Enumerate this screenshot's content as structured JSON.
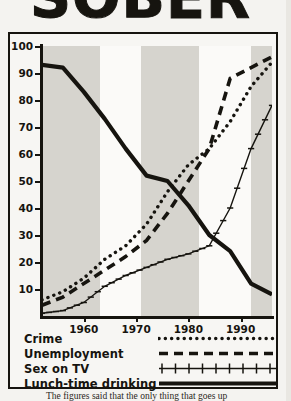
{
  "headline": {
    "text": "SOBER"
  },
  "caption": {
    "text": "The figures said that the only thing that goes up"
  },
  "chart": {
    "yaxis": {
      "ticks": [
        100,
        90,
        80,
        70,
        60,
        50,
        40,
        30,
        20,
        10
      ],
      "min": 0,
      "max": 100
    },
    "xaxis": {
      "ticks": [
        1960,
        1970,
        1980,
        1990
      ],
      "min": 1952,
      "max": 1996
    },
    "bands": [
      {
        "from": 1952,
        "to": 1963
      },
      {
        "from": 1971,
        "to": 1982
      },
      {
        "from": 1992,
        "to": 1996
      }
    ]
  },
  "legend": {
    "items": [
      {
        "label": "Crime",
        "style": "dotted"
      },
      {
        "label": "Unemployment",
        "style": "dashed"
      },
      {
        "label": "Sex on TV",
        "style": "cross"
      },
      {
        "label": "Lunch-time drinking",
        "style": "solid"
      }
    ]
  },
  "colors": {
    "ink": "#16140f",
    "band": "#cfcdc7",
    "paper": "#fbfaf8"
  },
  "chart_data": {
    "type": "line",
    "title": "",
    "xlabel": "",
    "ylabel": "",
    "xlim": [
      1952,
      1996
    ],
    "ylim": [
      0,
      100
    ],
    "grid": false,
    "legend_position": "below",
    "series": [
      {
        "name": "Crime",
        "style": "dotted",
        "x": [
          1952,
          1956,
          1960,
          1964,
          1968,
          1972,
          1976,
          1980,
          1984,
          1988,
          1992,
          1996
        ],
        "values": [
          6,
          9,
          14,
          21,
          26,
          34,
          46,
          56,
          62,
          72,
          85,
          94
        ]
      },
      {
        "name": "Unemployment",
        "style": "dashed",
        "x": [
          1952,
          1956,
          1960,
          1964,
          1968,
          1972,
          1976,
          1980,
          1984,
          1988,
          1992,
          1996
        ],
        "values": [
          4,
          7,
          12,
          17,
          22,
          28,
          38,
          50,
          62,
          88,
          92,
          96
        ]
      },
      {
        "name": "Sex on TV",
        "style": "cross",
        "x": [
          1952,
          1956,
          1960,
          1964,
          1968,
          1972,
          1976,
          1980,
          1984,
          1988,
          1992,
          1996
        ],
        "values": [
          1,
          2,
          5,
          11,
          15,
          18,
          21,
          23,
          26,
          40,
          62,
          78
        ]
      },
      {
        "name": "Lunch-time drinking",
        "style": "solid",
        "x": [
          1952,
          1956,
          1960,
          1964,
          1968,
          1972,
          1976,
          1980,
          1984,
          1988,
          1992,
          1996
        ],
        "values": [
          93,
          92,
          83,
          73,
          62,
          52,
          50,
          41,
          30,
          24,
          12,
          8
        ]
      }
    ]
  }
}
